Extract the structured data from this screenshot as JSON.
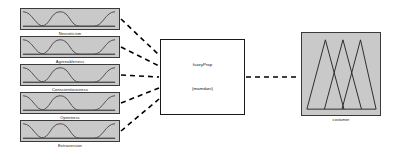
{
  "diagram": {
    "type": "fuzzy-inference-system",
    "inputs": [
      {
        "label": "Neuroticism",
        "x": 20,
        "y": 8
      },
      {
        "label": "Agreeableness",
        "x": 20,
        "y": 36
      },
      {
        "label": "Conscientiousness",
        "x": 20,
        "y": 64
      },
      {
        "label": "Openness",
        "x": 20,
        "y": 92
      },
      {
        "label": "Extraversion",
        "x": 20,
        "y": 120
      }
    ],
    "center": {
      "title": "fuzzyProp",
      "subtitle": "(mamdani)"
    },
    "output": {
      "label": "costumer",
      "membership_count": 3
    },
    "colors": {
      "block_fill": "#c9c9c9",
      "block_border": "#3a3a3a",
      "center_border": "#1a1a1a",
      "wire": "#000000",
      "curve": "#4a4a4a",
      "background": "#ffffff"
    },
    "connections": [
      {
        "from": "Neuroticism",
        "to": "fuzzyProp"
      },
      {
        "from": "Agreeableness",
        "to": "fuzzyProp"
      },
      {
        "from": "Conscientiousness",
        "to": "fuzzyProp"
      },
      {
        "from": "Openness",
        "to": "fuzzyProp"
      },
      {
        "from": "Extraversion",
        "to": "fuzzyProp"
      },
      {
        "from": "fuzzyProp",
        "to": "costumer"
      }
    ]
  }
}
